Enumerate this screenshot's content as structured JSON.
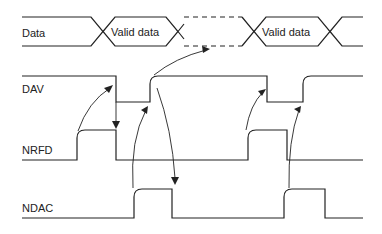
{
  "diagram": {
    "type": "timing-diagram",
    "title": "",
    "signals": [
      {
        "id": "data",
        "label": "Data"
      },
      {
        "id": "dav",
        "label": "DAV"
      },
      {
        "id": "nrfd",
        "label": "NRFD"
      },
      {
        "id": "ndac",
        "label": "NDAC"
      }
    ],
    "data_bus_segments": [
      {
        "label": "",
        "state": "idle"
      },
      {
        "label": "Valid data",
        "state": "valid"
      },
      {
        "label": "",
        "state": "dashed / invalid"
      },
      {
        "label": "Valid data",
        "state": "valid"
      },
      {
        "label": "",
        "state": "idle"
      }
    ],
    "causal_arrows": [
      {
        "from": "NRFD rising",
        "to": "DAV falling"
      },
      {
        "from": "DAV falling",
        "to": "NRFD falling"
      },
      {
        "from": "NDAC rising",
        "to": "DAV rising"
      },
      {
        "from": "DAV rising",
        "to": "Data invalid"
      },
      {
        "from": "DAV high",
        "to": "NDAC falling"
      },
      {
        "from": "NRFD rising (2)",
        "to": "DAV falling (2)"
      },
      {
        "from": "NDAC rising (2)",
        "to": "DAV rising (2)"
      }
    ],
    "colors": {
      "line": "#222222",
      "background": "#ffffff"
    }
  }
}
